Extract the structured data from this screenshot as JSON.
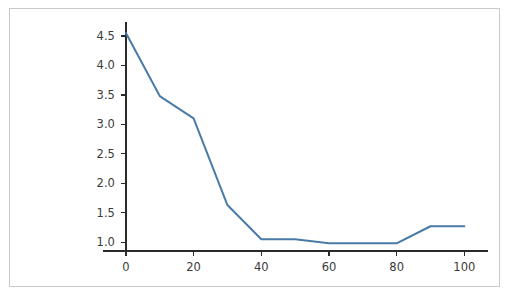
{
  "chart_data": {
    "type": "line",
    "title": "",
    "subtitle": "",
    "xlabel": "",
    "ylabel": "",
    "x": [
      0,
      10,
      20,
      30,
      40,
      50,
      60,
      70,
      80,
      90,
      100
    ],
    "values": [
      4.55,
      3.48,
      3.1,
      1.63,
      1.05,
      1.05,
      0.98,
      0.98,
      0.98,
      1.27,
      1.27
    ],
    "series": [
      {
        "name": "",
        "values": [
          4.55,
          3.48,
          3.1,
          1.63,
          1.05,
          1.05,
          0.98,
          0.98,
          0.98,
          1.27,
          1.27
        ]
      }
    ],
    "xlim": [
      -5,
      107
    ],
    "ylim": [
      0.85,
      4.72
    ],
    "xticks": [
      0,
      20,
      40,
      60,
      80,
      100
    ],
    "xtick_labels": [
      "0",
      "20",
      "40",
      "60",
      "80",
      "100"
    ],
    "yticks": [
      1.0,
      1.5,
      2.0,
      2.5,
      3.0,
      3.5,
      4.0,
      4.5
    ],
    "ytick_labels": [
      "1.0",
      "1.5",
      "2.0",
      "2.5",
      "3.0",
      "3.5",
      "4.0",
      "4.5"
    ],
    "grid": false,
    "legend": false,
    "legend_position": "none",
    "annotations": [],
    "colors": {
      "line": "#4a7ba7",
      "axis": "#2a2a2a",
      "tick_text": "#3b3b3b",
      "frame_border": "#c9c9c9",
      "background": "#ffffff"
    }
  }
}
